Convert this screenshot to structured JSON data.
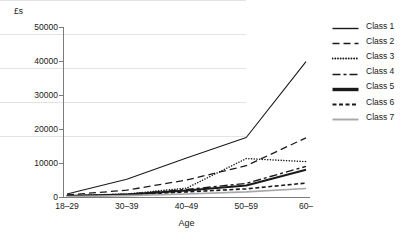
{
  "chart_data": {
    "type": "line",
    "title": "",
    "xlabel": "Age",
    "ylabel": "£s",
    "categories": [
      "18–29",
      "30–39",
      "40–49",
      "50–59",
      "60–"
    ],
    "ylim": [
      0,
      50000
    ],
    "ytick_labels": [
      "0",
      "10000",
      "20000",
      "30000",
      "40000",
      "50000"
    ],
    "ytick_values": [
      0,
      10000,
      20000,
      30000,
      40000,
      50000
    ],
    "grid": "horizontal",
    "legend_position": "right",
    "series": [
      {
        "name": "Class 1",
        "values": [
          900,
          5200,
          11500,
          17500,
          39800
        ],
        "style": "solid",
        "color": "#1a1a1a",
        "width": 1.1
      },
      {
        "name": "Class 2",
        "values": [
          600,
          2000,
          5000,
          9200,
          17400
        ],
        "style": "dashed",
        "color": "#1a1a1a",
        "width": 1.3
      },
      {
        "name": "Class 3",
        "values": [
          400,
          900,
          2600,
          11300,
          10400
        ],
        "style": "dotted",
        "color": "#1a1a1a",
        "width": 1.5
      },
      {
        "name": "Class 4",
        "values": [
          350,
          800,
          2200,
          4000,
          9000
        ],
        "style": "dashdot",
        "color": "#1a1a1a",
        "width": 1.4
      },
      {
        "name": "Class 5",
        "values": [
          300,
          700,
          1900,
          3400,
          8000
        ],
        "style": "thick-solid",
        "color": "#1a1a1a",
        "width": 2.1
      },
      {
        "name": "Class 6",
        "values": [
          250,
          600,
          1500,
          2400,
          4100
        ],
        "style": "short-dash",
        "color": "#1a1a1a",
        "width": 1.6
      },
      {
        "name": "Class 7",
        "values": [
          150,
          400,
          900,
          1500,
          2500
        ],
        "style": "solid",
        "color": "#a8a8a8",
        "width": 1.6
      }
    ]
  }
}
